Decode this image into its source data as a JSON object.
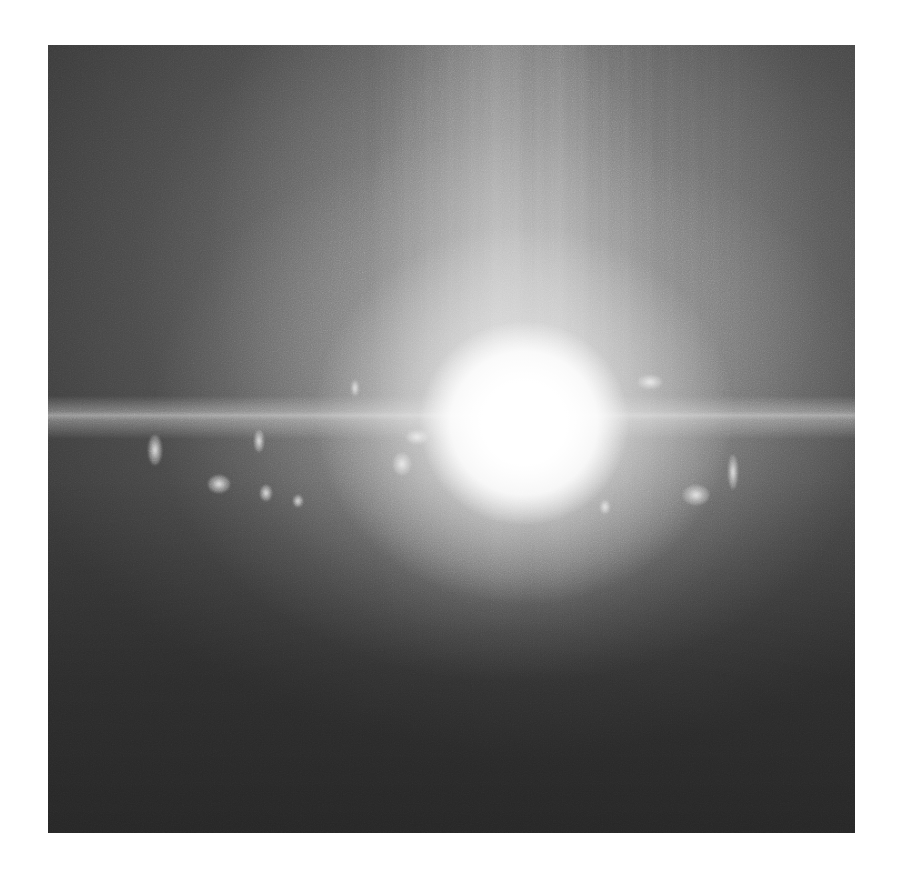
{
  "image": {
    "description": "Grayscale photograph of an intense white light burst with a horizontal lens-flare line and vertical light streaks, surrounded by glowing wispy particles on a dark textured background",
    "palette": {
      "page_background": "#ffffff",
      "dark": "#3a3a3a",
      "mid": "#7a7a7a",
      "highlight": "#ffffff"
    },
    "frame": {
      "left": 48,
      "top": 45,
      "width": 807,
      "height": 788
    },
    "features": {
      "burst_center": {
        "x_pct": 59,
        "y_pct": 48
      },
      "flare_line_y_pct": 47,
      "wisps": [
        {
          "x": 100,
          "y": 390,
          "w": 14,
          "h": 30
        },
        {
          "x": 160,
          "y": 430,
          "w": 22,
          "h": 18
        },
        {
          "x": 206,
          "y": 385,
          "w": 10,
          "h": 22
        },
        {
          "x": 212,
          "y": 440,
          "w": 12,
          "h": 16
        },
        {
          "x": 303,
          "y": 335,
          "w": 8,
          "h": 16
        },
        {
          "x": 358,
          "y": 385,
          "w": 22,
          "h": 14
        },
        {
          "x": 345,
          "y": 408,
          "w": 18,
          "h": 22
        },
        {
          "x": 590,
          "y": 330,
          "w": 24,
          "h": 14
        },
        {
          "x": 635,
          "y": 440,
          "w": 26,
          "h": 20
        },
        {
          "x": 680,
          "y": 410,
          "w": 10,
          "h": 34
        },
        {
          "x": 552,
          "y": 455,
          "w": 10,
          "h": 14
        },
        {
          "x": 245,
          "y": 450,
          "w": 10,
          "h": 12
        }
      ]
    }
  }
}
